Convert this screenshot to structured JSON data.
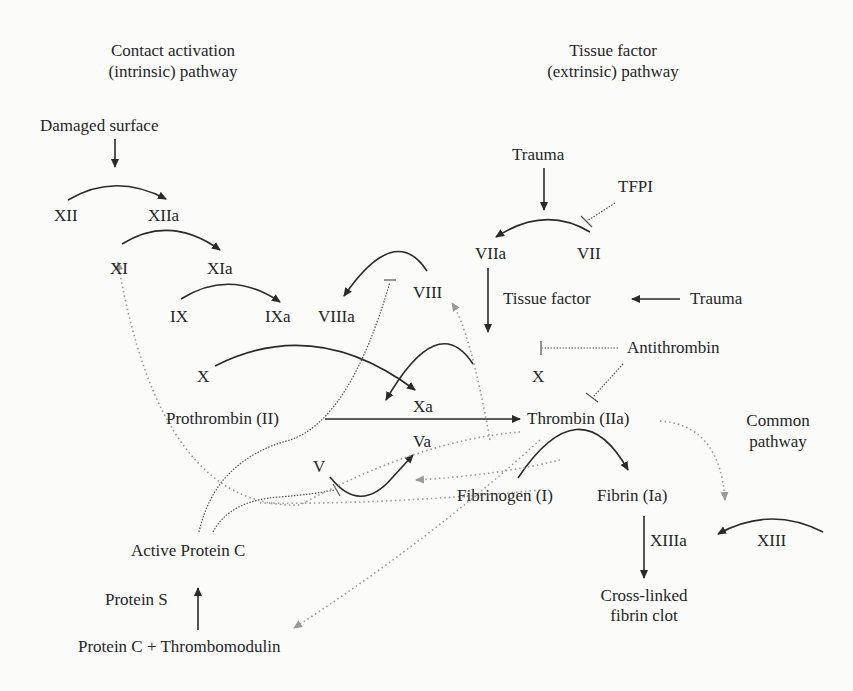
{
  "diagram": {
    "type": "coagulation-cascade",
    "colors": {
      "solid": "#2a2a2a",
      "dotted_dark": "#555555",
      "dotted_light": "#9a9a9a",
      "background": "#fbfbfa"
    },
    "headings": {
      "intrinsic": [
        "Contact activation",
        "(intrinsic) pathway"
      ],
      "extrinsic": [
        "Tissue factor",
        "(extrinsic) pathway"
      ],
      "common": [
        "Common",
        "pathway"
      ]
    },
    "nodes": {
      "damaged_surface": "Damaged surface",
      "xii": "XII",
      "xiia": "XIIa",
      "xi": "XI",
      "xia": "XIa",
      "ix": "IX",
      "ixa": "IXa",
      "viiia": "VIIIa",
      "viii": "VIII",
      "x_left": "X",
      "xa": "Xa",
      "va": "Va",
      "v": "V",
      "prothrombin": "Prothrombin (II)",
      "thrombin": "Thrombin (IIa)",
      "trauma_top": "Trauma",
      "tfpi": "TFPI",
      "viia": "VIIa",
      "vii": "VII",
      "tissue_factor": "Tissue factor",
      "trauma_right": "Trauma",
      "antithrombin": "Antithrombin",
      "x_right": "X",
      "fibrinogen": "Fibrinogen (I)",
      "fibrin": "Fibrin (Ia)",
      "xiiia": "XIIIa",
      "xiii": "XIII",
      "clot": [
        "Cross-linked",
        "fibrin clot"
      ],
      "active_protein_c": "Active Protein C",
      "protein_s": "Protein S",
      "protein_c_thrombomodulin": "Protein C + Thrombomodulin"
    },
    "edges": [
      {
        "from": "Damaged surface",
        "to": "XII→XIIa",
        "style": "solid-arrow"
      },
      {
        "from": "XII",
        "to": "XIIa",
        "style": "solid-curved-arrow"
      },
      {
        "from": "XI",
        "to": "XIa",
        "style": "solid-curved-arrow"
      },
      {
        "from": "IX",
        "to": "IXa",
        "style": "solid-curved-arrow"
      },
      {
        "from": "VIII",
        "to": "VIIIa",
        "style": "solid-curved-arrow"
      },
      {
        "from": "X",
        "to": "Xa",
        "style": "solid-curved-arrow"
      },
      {
        "from": "X (extrinsic)",
        "to": "Xa",
        "style": "solid-curved-arrow"
      },
      {
        "from": "Prothrombin (II)",
        "to": "Thrombin (IIa)",
        "style": "solid-arrow"
      },
      {
        "from": "V",
        "to": "Va",
        "style": "solid-curved-arrow"
      },
      {
        "from": "Trauma",
        "to": "VII→VIIa",
        "style": "solid-arrow"
      },
      {
        "from": "VII",
        "to": "VIIa",
        "style": "solid-curved-arrow"
      },
      {
        "from": "VIIa",
        "to": "X (extrinsic)",
        "style": "solid-arrow"
      },
      {
        "from": "Trauma",
        "to": "Tissue factor",
        "style": "solid-arrow"
      },
      {
        "from": "TFPI",
        "to": "VII→VIIa",
        "style": "dotted-inhibit"
      },
      {
        "from": "Antithrombin",
        "to": "X→Xa",
        "style": "dotted-inhibit"
      },
      {
        "from": "Antithrombin",
        "to": "Thrombin (IIa)",
        "style": "dotted-inhibit"
      },
      {
        "from": "Fibrinogen (I)",
        "to": "Fibrin (Ia)",
        "style": "solid-curved-arrow"
      },
      {
        "from": "Fibrin (Ia)",
        "to": "Cross-linked fibrin clot",
        "style": "solid-arrow"
      },
      {
        "from": "XIII",
        "to": "XIIIa",
        "style": "solid-curved-arrow"
      },
      {
        "from": "Thrombin (IIa)",
        "to": "XIII→XIIIa",
        "style": "dotted-light-arrow"
      },
      {
        "from": "Thrombin (IIa)",
        "to": "XI",
        "style": "dotted-light-arrow"
      },
      {
        "from": "Thrombin (IIa)",
        "to": "VIII",
        "style": "dotted-light-arrow"
      },
      {
        "from": "Thrombin (IIa)",
        "to": "Va",
        "style": "dotted-light-arrow"
      },
      {
        "from": "Thrombin (IIa)",
        "to": "Protein C + Thrombomodulin",
        "style": "dotted-light-arrow"
      },
      {
        "from": "Active Protein C",
        "to": "VIII",
        "style": "dotted-inhibit"
      },
      {
        "from": "Active Protein C",
        "to": "V",
        "style": "dotted-inhibit"
      },
      {
        "from": "Protein C + Thrombomodulin",
        "to": "Active Protein C",
        "style": "solid-arrow"
      }
    ]
  }
}
